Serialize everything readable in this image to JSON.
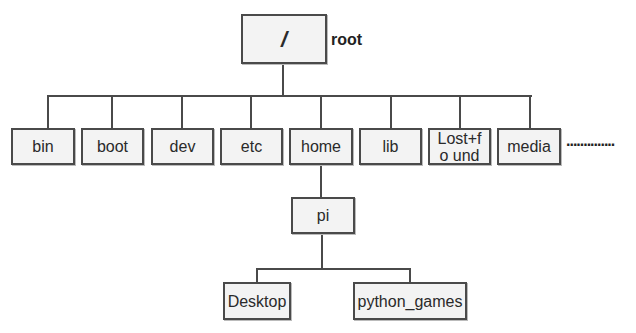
{
  "diagram": {
    "root": {
      "label": "/",
      "caption": "root"
    },
    "level1": [
      {
        "label": "bin"
      },
      {
        "label": "boot"
      },
      {
        "label": "dev"
      },
      {
        "label": "etc"
      },
      {
        "label": "home"
      },
      {
        "label": "lib"
      },
      {
        "label": "Lost+fo und"
      },
      {
        "label": "media"
      }
    ],
    "continuation": "..............",
    "home_child": {
      "label": "pi"
    },
    "pi_children": [
      {
        "label": "Desktop"
      },
      {
        "label": "python_games"
      }
    ],
    "colors": {
      "box_fill": "#f3f3f3",
      "box_border": "#4a4a4a",
      "line": "#4a4a4a"
    }
  }
}
